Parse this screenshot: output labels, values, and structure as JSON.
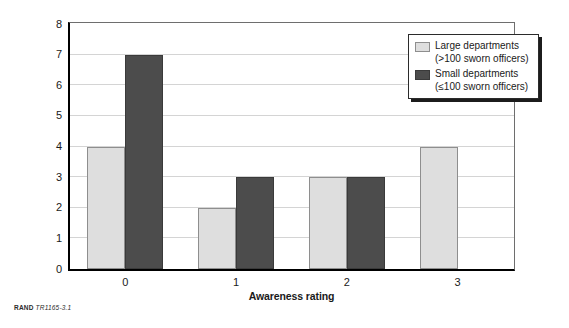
{
  "chart_data": {
    "type": "bar",
    "title": "",
    "xlabel": "Awareness rating",
    "ylabel": "Number of departments",
    "categories": [
      "0",
      "1",
      "2",
      "3"
    ],
    "series": [
      {
        "name": "Large departments (>100 sworn officers)",
        "short_name": "Large departments",
        "qualifier": "(>100 sworn officers)",
        "color": "#dedede",
        "values": [
          4,
          2,
          3,
          4
        ]
      },
      {
        "name": "Small departments (≤100 sworn officers)",
        "short_name": "Small departments",
        "qualifier": "(≤100 sworn officers)",
        "color": "#4c4c4c",
        "values": [
          7,
          3,
          3,
          0
        ]
      }
    ],
    "ylim": [
      0,
      8
    ],
    "ytick_labels": [
      "0",
      "1",
      "2",
      "3",
      "4",
      "5",
      "6",
      "7",
      "8"
    ],
    "ytick_values": [
      0,
      1,
      2,
      3,
      4,
      5,
      6,
      7,
      8
    ],
    "grid": "horizontal",
    "legend_position": "top-right"
  },
  "legend": {
    "entries": [
      {
        "label": "Large departments",
        "sub": "(>100 sworn officers)",
        "swatch": "light"
      },
      {
        "label": "Small departments",
        "sub": "(≤100 sworn officers)",
        "swatch": "dark"
      }
    ]
  },
  "credit": {
    "source": "RAND",
    "figure_number": "TR1165-3.1"
  },
  "colors": {
    "light_bar": "#dedede",
    "dark_bar": "#4c4c4c",
    "axis": "#000000",
    "gridline": "#d4d4d4",
    "plot_border": "#6e6e6e"
  }
}
